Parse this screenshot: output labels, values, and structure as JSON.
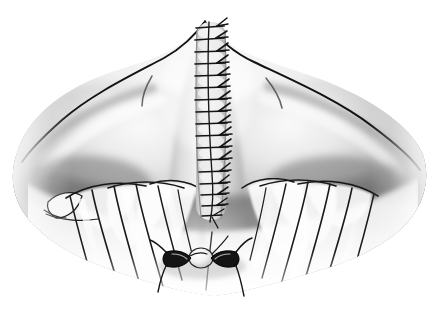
{
  "figure": {
    "kind": "medical-illustration",
    "title": "Midline closure of posterior neck incision",
    "style": "grayscale airbrush and pen-and-ink medical illustration",
    "background_color": "#ffffff",
    "width": 442,
    "height": 311,
    "caption": "",
    "labels": [],
    "annotations": [],
    "colors": {
      "background": "#ffffff",
      "ink_outline": "#141414",
      "suture_thread": "#1a1a1a",
      "highlight": "#fbfbfb",
      "light_tone": "#e9e9e9",
      "mid_tone": "#bdbdbd",
      "shadow_tone": "#8d8d8d",
      "deep_shadow": "#6a6a6a",
      "darkest": "#4a4a4a"
    },
    "regions": [
      {
        "name": "left-shoulder-mass",
        "description": "broad rounded shoulder / trapezius mass sweeping down to the left, soft airbrush gradient fading to white at the outer margin",
        "tone": "light_tone"
      },
      {
        "name": "right-shoulder-mass",
        "description": "mirror-image rounded shoulder mass sweeping down to the right with a crisp dark outline along its upper border",
        "tone": "light_tone"
      },
      {
        "name": "central-neck-column",
        "description": "raised midline column of the posterior neck rising to an apex at the top center",
        "tone": "light_tone"
      },
      {
        "name": "left-fascial-fan",
        "description": "fan of radiating muscular / fascial striations on the lower left, with a small isolated lobe at the far left",
        "tone": "highlight"
      },
      {
        "name": "right-fascial-fan",
        "description": "mirror fan of radiating muscular / fascial striations on the lower right",
        "tone": "highlight"
      },
      {
        "name": "deep-shadow-band",
        "description": "dark transverse shadow band separating the shoulder masses from the fascial fans",
        "tone": "deep_shadow"
      }
    ],
    "suture_line": {
      "name": "midline-interrupted-suture-line",
      "description": "vertical running line of interrupted sutures closing the midline incision",
      "stitch_count": 17,
      "orientation": "vertical",
      "top_y": 22,
      "bottom_y": 220,
      "center_x": 211,
      "knot_side": "right",
      "thread_color": "#1a1a1a"
    },
    "inferior_sutures": {
      "name": "inferior-paired-suture-knots",
      "description": "two dark triangular suture knots flanking a pale rounded tissue bead at the inferior apex of the closure",
      "count": 2,
      "bead_description": "pale round tissue nodule between the two knots",
      "center_x": 202,
      "center_y": 262
    }
  }
}
